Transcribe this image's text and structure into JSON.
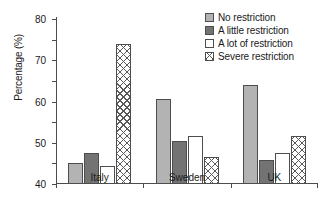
{
  "chart_data": {
    "type": "bar",
    "title": "",
    "xlabel": "",
    "ylabel": "Percentage (%)",
    "ylim": [
      0,
      80
    ],
    "ytick_step": 10,
    "yticks": [
      0,
      10,
      20,
      30,
      40,
      50,
      60,
      70,
      80
    ],
    "grid": false,
    "legend_position": "top-right",
    "categories": [
      "Italy",
      "Sweden",
      "UK"
    ],
    "series": [
      {
        "name": "No restriction",
        "values": [
          10,
          41,
          48
        ],
        "color": "#b3b3b3",
        "pattern": "solid-light-grey"
      },
      {
        "name": "A little restriction",
        "values": [
          15,
          21,
          11.5
        ],
        "color": "#737373",
        "pattern": "solid-dark-grey"
      },
      {
        "name": "A lot of restriction",
        "values": [
          8.5,
          23.5,
          15
        ],
        "color": "#ffffff",
        "pattern": "solid-white"
      },
      {
        "name": "Severe restriction",
        "values": [
          68,
          13,
          23.5
        ],
        "color": "#ffffff",
        "pattern": "crosshatch"
      }
    ]
  },
  "axis": {
    "y_label": "Percentage (%)",
    "y_tick_labels": [
      "0",
      "10",
      "20",
      "30",
      "40",
      "50",
      "60",
      "70",
      "80"
    ],
    "x_tick_labels": [
      "Italy",
      "Sweden",
      "UK"
    ]
  },
  "legend": {
    "items": [
      {
        "label": "No restriction",
        "swatch": "legend-swatch-no-restriction"
      },
      {
        "label": "A little restriction",
        "swatch": "legend-swatch-a-little-restriction"
      },
      {
        "label": "A lot of restriction",
        "swatch": "legend-swatch-a-lot-of-restriction"
      },
      {
        "label": "Severe restriction",
        "swatch": "legend-swatch-severe-restriction"
      }
    ]
  },
  "colors": {
    "no_restriction": "#b3b3b3",
    "a_little_restriction": "#737373",
    "a_lot_of_restriction": "#ffffff",
    "severe_restriction": "#ffffff",
    "axis": "#4d4d4d",
    "text": "#1a1a1a"
  }
}
